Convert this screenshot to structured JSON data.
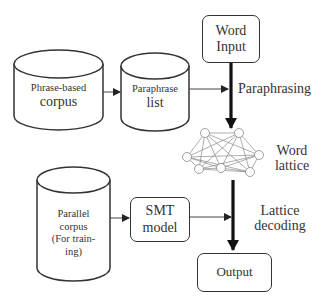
{
  "diagram": {
    "nodes": {
      "phrase_corpus": {
        "line1": "Phrase-based",
        "line2": "corpus",
        "shape": "cylinder"
      },
      "paraphrase_list": {
        "line1": "Paraphrase",
        "line2": "list",
        "shape": "cylinder"
      },
      "word_input": {
        "line1": "Word",
        "line2": "Input",
        "shape": "rounded-box"
      },
      "word_lattice": {
        "line1": "Word",
        "line2": "lattice",
        "shape": "graph"
      },
      "parallel_corpus": {
        "line1": "Parallel",
        "line2": "corpus",
        "line3": "(For train-",
        "line4": "ing)",
        "shape": "cylinder"
      },
      "smt_model": {
        "line1": "SMT",
        "line2": "model",
        "shape": "rounded-box"
      },
      "output": {
        "label": "Output",
        "shape": "rounded-box"
      }
    },
    "edges": [
      {
        "from": "phrase_corpus",
        "to": "paraphrase_list",
        "style": "thin"
      },
      {
        "from": "paraphrase_list",
        "to": "paraphrasing_step",
        "style": "thin"
      },
      {
        "from": "word_input",
        "to": "word_lattice",
        "style": "thick",
        "label": "Paraphrasing"
      },
      {
        "from": "parallel_corpus",
        "to": "smt_model",
        "style": "thin"
      },
      {
        "from": "smt_model",
        "to": "decoding_step",
        "style": "thin"
      },
      {
        "from": "word_lattice",
        "to": "output",
        "style": "thick",
        "label": "Lattice decoding"
      }
    ],
    "edge_labels": {
      "paraphrasing": "Paraphrasing",
      "lattice_decoding_1": "Lattice",
      "lattice_decoding_2": "decoding"
    }
  }
}
